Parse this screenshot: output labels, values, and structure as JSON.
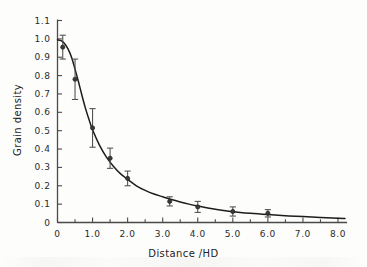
{
  "chart_data": {
    "type": "scatter",
    "title": "",
    "subtitle": "",
    "xlabel": "Distance /HD",
    "ylabel": "Grain density",
    "xlim": [
      0,
      8.2
    ],
    "ylim": [
      0,
      1.1
    ],
    "grid": false,
    "legend": null,
    "legend_position": "none",
    "xticks": [
      "0",
      "1.0",
      "2.0",
      "3.0",
      "4.0",
      "5.0",
      "6.0",
      "7.0",
      "8.0"
    ],
    "xtick_values": [
      0,
      1,
      2,
      3,
      4,
      5,
      6,
      7,
      8
    ],
    "xminor_step": 0.5,
    "yticks": [
      "0",
      "0.1",
      "0.2",
      "0.3",
      "0.4",
      "0.5",
      "0.6",
      "0.7",
      "0.8",
      "0.9",
      "1.0",
      "1.1"
    ],
    "ytick_values": [
      0,
      0.1,
      0.2,
      0.3,
      0.4,
      0.5,
      0.6,
      0.7,
      0.8,
      0.9,
      1.0,
      1.1
    ],
    "series": [
      {
        "name": "Grain density measurements",
        "marker": "circle",
        "color": "#3a3a3a",
        "x": [
          0.15,
          0.5,
          1.0,
          1.5,
          2.0,
          3.2,
          4.0,
          5.0,
          6.0
        ],
        "values": [
          0.955,
          0.78,
          0.515,
          0.35,
          0.24,
          0.115,
          0.085,
          0.06,
          0.05
        ],
        "yerr": [
          0.065,
          0.11,
          0.105,
          0.055,
          0.04,
          0.025,
          0.03,
          0.025,
          0.02
        ]
      },
      {
        "name": "Fitted decay curve",
        "marker": "none",
        "color": "#1d1d1d",
        "x": [
          0.0,
          0.1,
          0.2,
          0.3,
          0.4,
          0.5,
          0.6,
          0.7,
          0.8,
          0.9,
          1.0,
          1.2,
          1.4,
          1.6,
          1.8,
          2.0,
          2.25,
          2.5,
          2.75,
          3.0,
          3.25,
          3.5,
          3.75,
          4.0,
          4.5,
          5.0,
          5.5,
          6.0,
          6.5,
          7.0,
          7.5,
          8.0,
          8.2
        ],
        "values": [
          0.995,
          0.99,
          0.975,
          0.945,
          0.9,
          0.835,
          0.765,
          0.69,
          0.62,
          0.56,
          0.505,
          0.42,
          0.355,
          0.305,
          0.265,
          0.235,
          0.2,
          0.175,
          0.155,
          0.14,
          0.125,
          0.112,
          0.1,
          0.09,
          0.072,
          0.059,
          0.05,
          0.043,
          0.037,
          0.032,
          0.027,
          0.023,
          0.022
        ]
      }
    ]
  },
  "axes": {
    "x_title": "Distance /HD",
    "y_title": "Grain density"
  },
  "colors": {
    "axis": "#4a4a4a",
    "curve": "#1d1d1d",
    "marker": "#3a3a3a",
    "error_bar": "#4d4d4d",
    "text": "#2b2b2b",
    "background": "#fdfdfb"
  }
}
